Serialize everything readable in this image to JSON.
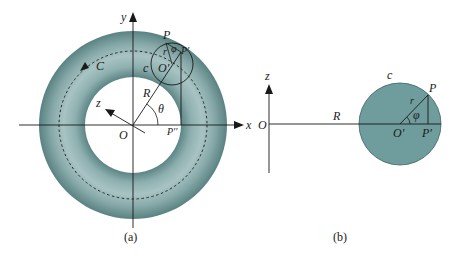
{
  "figure": {
    "colors": {
      "torus_edge": "#5d8585",
      "torus_mid": "#a2bfbf",
      "section_fill": "#6f9c9c",
      "line": "#1a1a1a",
      "background": "#ffffff"
    },
    "panel_a": {
      "caption": "(a)",
      "axis_x_label": "x",
      "axis_y_label": "y",
      "axis_z_label": "z",
      "origin_label": "O",
      "curve_label": "C",
      "section_label": "c",
      "center_label": "O'",
      "point_P_label": "P",
      "point_P1_label": "P'",
      "point_P2_label": "P''",
      "radius_R_label": "R",
      "radius_r_label": "r",
      "angle_theta_label": "θ",
      "angle_phi_label": "φ"
    },
    "panel_b": {
      "caption": "(b)",
      "axis_z_label": "z",
      "origin_label": "O",
      "radius_R_label": "R",
      "section_label": "c",
      "center_label": "O'",
      "point_P_label": "P",
      "point_P1_label": "P'",
      "radius_r_label": "r",
      "angle_phi_label": "φ"
    }
  }
}
